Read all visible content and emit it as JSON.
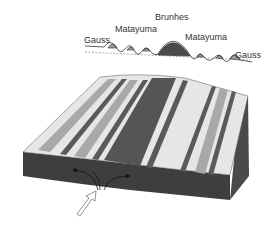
{
  "diagram": {
    "type": "seafloor-spreading-magnetic-stripes",
    "profile_labels": [
      {
        "id": "gauss-left",
        "text": "Gauss"
      },
      {
        "id": "matayuma-left",
        "text": "Matayuma"
      },
      {
        "id": "brunhes",
        "text": "Brunhes"
      },
      {
        "id": "matayuma-right",
        "text": "Matayuma"
      },
      {
        "id": "gauss-right",
        "text": "Gauss"
      }
    ],
    "colors": {
      "background": "#ffffff",
      "crust_top_light": "#e6e6e6",
      "stripe_medium": "#a8a8a8",
      "stripe_dark": "#5a5a5a",
      "central_stripe": "#555555",
      "block_side": "#4a4a4a",
      "block_front": "#3e3e3e",
      "profile_fill": "#9a9a9a",
      "profile_central_fill": "#4a4a4a",
      "line": "#333333"
    }
  }
}
